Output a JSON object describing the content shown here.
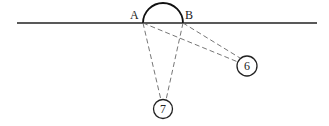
{
  "diagram": {
    "type": "geometry-sightlines",
    "baseline": {
      "x1": 17,
      "y1": 23,
      "x2": 317,
      "y2": 23,
      "color": "#222222"
    },
    "arc": {
      "from": "A",
      "to": "B",
      "center": [
        163,
        23
      ],
      "radius": 20,
      "color": "#111111"
    },
    "points": [
      {
        "id": "A",
        "label": "A",
        "x": 143,
        "y": 23,
        "label_x": 130,
        "label_y": 19
      },
      {
        "id": "B",
        "label": "B",
        "x": 183,
        "y": 23,
        "label_x": 185,
        "label_y": 19
      }
    ],
    "nodes": [
      {
        "id": "6",
        "label": "6",
        "cx": 247,
        "cy": 66,
        "r": 10
      },
      {
        "id": "7",
        "label": "7",
        "cx": 163,
        "cy": 109,
        "r": 9.5
      }
    ],
    "dashed_lines": [
      {
        "from": "A",
        "to": "7",
        "x1": 143,
        "y1": 23,
        "x2": 161,
        "y2": 100
      },
      {
        "from": "B",
        "to": "7",
        "x1": 183,
        "y1": 23,
        "x2": 166,
        "y2": 100
      },
      {
        "from": "A",
        "to": "6",
        "x1": 143,
        "y1": 23,
        "x2": 238,
        "y2": 62
      },
      {
        "from": "B",
        "to": "6",
        "x1": 183,
        "y1": 23,
        "x2": 240,
        "y2": 58
      }
    ],
    "dash_color": "#666666"
  }
}
